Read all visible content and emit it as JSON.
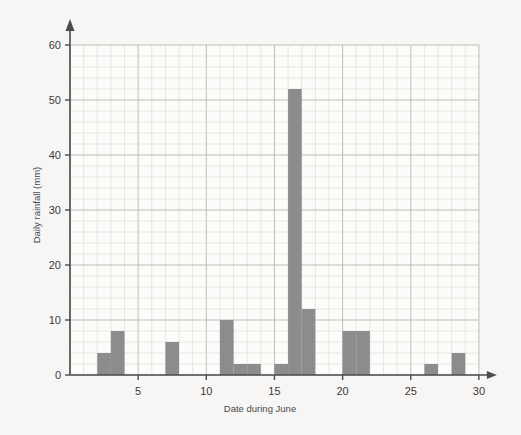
{
  "chart_data": {
    "type": "bar",
    "title": "",
    "xlabel": "Date during June",
    "ylabel": "Daily rainfall (mm)",
    "xlim": [
      0,
      30
    ],
    "ylim": [
      0,
      62
    ],
    "grid": true,
    "legend": null,
    "x_major_ticks": [
      5,
      10,
      15,
      20,
      25,
      30
    ],
    "x_tick_labels": [
      "5",
      "10",
      "15",
      "20",
      "25",
      "30"
    ],
    "y_major_ticks": [
      0,
      10,
      20,
      30,
      40,
      50,
      60
    ],
    "y_tick_labels": [
      "0",
      "10",
      "20",
      "30",
      "40",
      "50",
      "60"
    ],
    "x_minor_step": 1,
    "y_minor_step": 2,
    "bar_color": "#8c8c8c",
    "bin_width_days": 1,
    "categories": [
      2,
      3,
      7,
      11,
      12,
      13,
      15,
      16,
      17,
      20,
      21,
      26,
      28
    ],
    "values": [
      4,
      8,
      6,
      10,
      2,
      2,
      2,
      52,
      12,
      8,
      8,
      2,
      4
    ],
    "bars": [
      {
        "day_start": 2,
        "day_end": 3,
        "value": 4
      },
      {
        "day_start": 3,
        "day_end": 4,
        "value": 8
      },
      {
        "day_start": 7,
        "day_end": 8,
        "value": 6
      },
      {
        "day_start": 11,
        "day_end": 12,
        "value": 10
      },
      {
        "day_start": 12,
        "day_end": 13,
        "value": 2
      },
      {
        "day_start": 13,
        "day_end": 14,
        "value": 2
      },
      {
        "day_start": 15,
        "day_end": 16,
        "value": 2
      },
      {
        "day_start": 16,
        "day_end": 17,
        "value": 52
      },
      {
        "day_start": 17,
        "day_end": 18,
        "value": 12
      },
      {
        "day_start": 20,
        "day_end": 21,
        "value": 8
      },
      {
        "day_start": 21,
        "day_end": 22,
        "value": 8
      },
      {
        "day_start": 26,
        "day_end": 27,
        "value": 2
      },
      {
        "day_start": 28,
        "day_end": 29,
        "value": 4
      }
    ]
  }
}
